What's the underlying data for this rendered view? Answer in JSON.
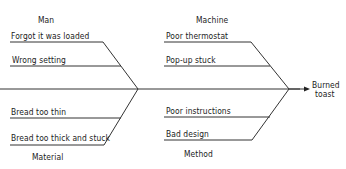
{
  "diagram": {
    "type": "fishbone",
    "effect": {
      "line1": "Burned",
      "line2": "toast"
    },
    "categories": {
      "man": {
        "label": "Man",
        "causes": [
          "Forgot it was loaded",
          "Wrong setting"
        ]
      },
      "machine": {
        "label": "Machine",
        "causes": [
          "Poor thermostat",
          "Pop-up stuck"
        ]
      },
      "material": {
        "label": "Material",
        "causes": [
          "Bread too thin",
          "Bread too thick and stuck"
        ]
      },
      "method": {
        "label": "Method",
        "causes": [
          "Poor instructions",
          "Bad design"
        ]
      }
    },
    "colors": {
      "line": "#333333",
      "text": "#1a1a1a",
      "background": "#ffffff"
    }
  }
}
